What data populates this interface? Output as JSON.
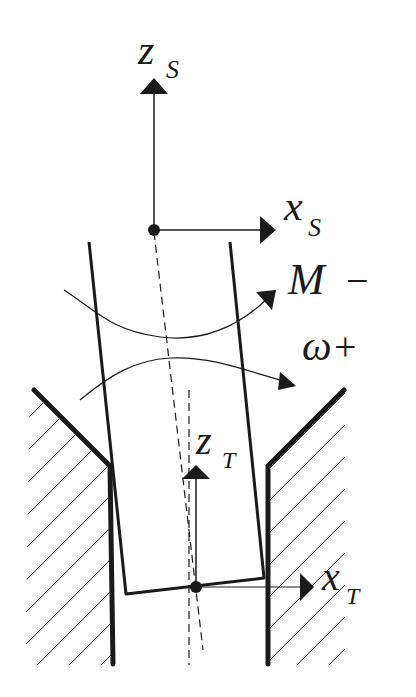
{
  "diagram": {
    "type": "tool-in-hole schematic with coordinate frames",
    "labels": {
      "zs_main": "z",
      "zs_sub": "S",
      "xs_main": "x",
      "xs_sub": "S",
      "moment_main": "M",
      "moment_sign": "−",
      "omega_main": "ω",
      "omega_sign": "+",
      "zt_main": "z",
      "zt_sub": "T",
      "xt_main": "x",
      "xt_sub": "T"
    },
    "colors": {
      "ink": "#1a1a1a",
      "background": "#ffffff"
    }
  }
}
